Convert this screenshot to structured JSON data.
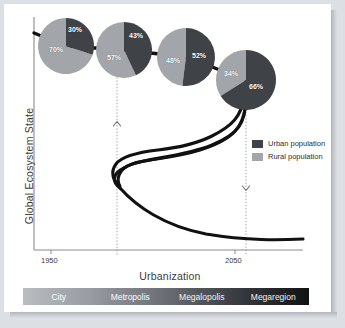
{
  "figure": {
    "background_color": "#dcdfe4",
    "card_color": "#ffffff"
  },
  "colors": {
    "urban": "#3f4246",
    "rural": "#a2a6aa",
    "curve": "#141414",
    "axis": "#8b8b8b",
    "guide_line": "#9a9a9a"
  },
  "axes": {
    "y_title": "Global Ecosystem State",
    "x_title": "Urbanization",
    "x_ticks": [
      "1950",
      "2050"
    ]
  },
  "legend": {
    "items": [
      {
        "label": "Urban population",
        "color": "#3f4246",
        "key": "urban"
      },
      {
        "label": "Rural population",
        "color": "#a2a6aa",
        "key": "rural"
      }
    ]
  },
  "scale_bar": {
    "segments": [
      "City",
      "Metropolis",
      "Megalopolis",
      "Megaregion"
    ]
  },
  "annotations": {
    "up_arrow": "up-chevron",
    "down_arrow": "down-chevron",
    "guides": [
      "1975-guide",
      "2050-guide"
    ]
  },
  "chart_data": {
    "type": "pie",
    "title": "",
    "xlabel": "Urbanization",
    "ylabel": "Global Ecosystem State",
    "grid": false,
    "legend_position": "right",
    "x_ticks": [
      "1950",
      "2050"
    ],
    "series": [
      {
        "name": "Urban population",
        "color": "#3f4246",
        "values": [
          30,
          43,
          52,
          66
        ]
      },
      {
        "name": "Rural population",
        "color": "#a2a6aa",
        "values": [
          70,
          57,
          48,
          34
        ]
      }
    ],
    "categories": [
      "City",
      "Metropolis",
      "Megalopolis",
      "Megaregion"
    ],
    "pies": [
      {
        "stage": "City",
        "cx": 66,
        "cy": 46,
        "r": 28,
        "urban": 30,
        "rural": 70,
        "urban_label": "30%",
        "rural_label": "70%",
        "urban_label_x": 68,
        "urban_label_y": 26,
        "rural_label_x": 49,
        "rural_label_y": 46
      },
      {
        "stage": "Metropolis",
        "cx": 124,
        "cy": 50,
        "r": 28,
        "urban": 43,
        "rural": 57,
        "urban_label": "43%",
        "rural_label": "57%",
        "urban_label_x": 129,
        "urban_label_y": 32,
        "rural_label_x": 107,
        "rural_label_y": 54
      },
      {
        "stage": "Megalopolis",
        "cx": 186,
        "cy": 57,
        "r": 29,
        "urban": 52,
        "rural": 48,
        "urban_label": "52%",
        "rural_label": "48%",
        "urban_label_x": 192,
        "urban_label_y": 52,
        "rural_label_x": 166,
        "rural_label_y": 57
      },
      {
        "stage": "Megaregion",
        "cx": 246,
        "cy": 80,
        "r": 30,
        "urban": 66,
        "rural": 34,
        "urban_label": "66%",
        "rural_label": "34%",
        "urban_label_x": 249,
        "urban_label_y": 83,
        "rural_label_x": 224,
        "rural_label_y": 70
      }
    ],
    "ecosystem_curve": {
      "description": "S-shaped fold/hysteresis curve of global ecosystem state vs urbanization",
      "shape": "bistable-fold"
    },
    "tipping_guides": [
      {
        "x": 117,
        "direction": "up",
        "note": "lower tipping threshold"
      },
      {
        "x": 246,
        "direction": "down",
        "note": "upper tipping threshold"
      }
    ]
  }
}
